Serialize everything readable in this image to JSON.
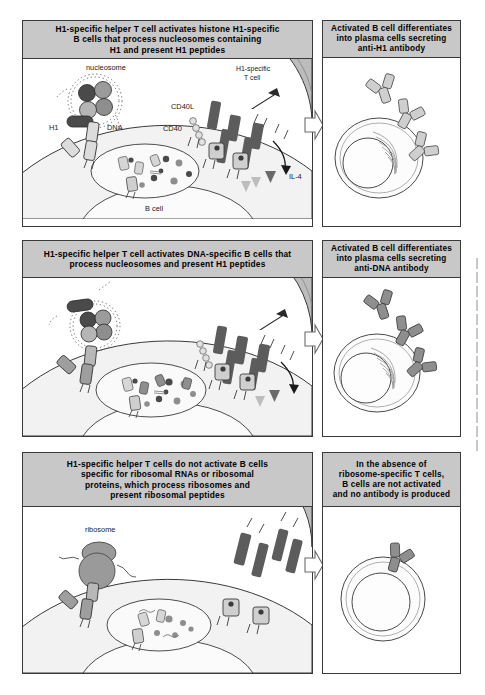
{
  "figure": {
    "type": "immunology-mechanism-diagram",
    "rows": [
      {
        "id": "row-1",
        "left_header": "H1-specific helper T cell activates histone H1-specific B cells that process nucleosomes containing H1 and present H1 peptides",
        "left_header_lines": [
          "H1-specific helper T cell activates histone H1-specific",
          "B cells that process nucleosomes containing",
          "H1 and present H1 peptides"
        ],
        "right_header": "Activated B cell differentiates into plasma cells secreting anti-H1 antibody",
        "right_header_lines": [
          "Activated B cell differentiates",
          "into plasma cells secreting",
          "anti-H1 antibody"
        ],
        "labels": [
          "nucleosome",
          "H1",
          "DNA",
          "H1-specific T cell",
          "CD40L",
          "CD40",
          "IL-4",
          "B cell"
        ],
        "t_cell_label_lines": [
          "H1-specific",
          "T cell"
        ],
        "outcome": "activated",
        "antibody_count": 3,
        "antibody_shade": "#cfcfcf"
      },
      {
        "id": "row-2",
        "left_header": "H1-specific helper T cell activates DNA-specific B cells that process nucleosomes and present H1 peptides",
        "left_header_lines": [
          "H1-specific helper T cell activates DNA-specific B cells that",
          "process nucleosomes and present H1 peptides"
        ],
        "right_header": "Activated B cell differentiates into plasma cells secreting anti-DNA antibody",
        "right_header_lines": [
          "Activated B cell differentiates",
          "into plasma cells secreting",
          "anti-DNA antibody"
        ],
        "labels": [],
        "outcome": "activated",
        "antibody_count": 3,
        "antibody_shade": "#8e8e8e"
      },
      {
        "id": "row-3",
        "left_header": "H1-specific helper T cells do not activate B cells specific for ribosomal RNAs or ribosomal proteins, which process ribosomes and present ribosomal peptides",
        "left_header_lines": [
          "H1-specific helper T cells do not activate B cells",
          "specific for ribosomal RNAs or ribosomal",
          "proteins, which process ribosomes and",
          "present ribosomal peptides"
        ],
        "right_header": "In the absence of ribosome-specific T cells, B cells are not activated and no antibody is produced",
        "right_header_lines": [
          "In the absence of",
          "ribosome-specific T cells,",
          "B cells are not activated",
          "and no antibody is produced"
        ],
        "labels": [
          "ribosome"
        ],
        "outcome": "not-activated",
        "antibody_count": 0,
        "antibody_shade": "#8e8e8e"
      }
    ],
    "palette": {
      "header_fill": "#c8c8c8",
      "panel_border": "#3a3a3a",
      "t_cell_fill": "#bcbcbc",
      "b_cell_fill": "#f2f2f2",
      "cd40l_dark": "#5c5c5c",
      "mhc_light": "#cfcfcf",
      "histone_dark": "#4a4a4a",
      "histone_mid": "#8e8e8e",
      "histone_light": "#b5b5b5",
      "arrow_outline": "#6a6a6a",
      "ribosome_fill": "#9a9a9a"
    }
  }
}
